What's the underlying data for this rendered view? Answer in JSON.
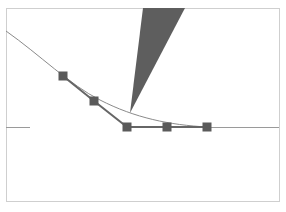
{
  "diagram": {
    "frame": {
      "x": 6,
      "y": 8,
      "width": 273,
      "height": 193,
      "stroke": "#cfcfcf"
    },
    "baseline": {
      "y": 127,
      "left_segment": [
        6,
        30
      ],
      "main_segment": [
        128,
        279
      ],
      "stroke": "#9a9a9a"
    },
    "curve": {
      "path": "M6,31 C40,55 70,85 100,100 C135,118 170,125 207,127",
      "stroke": "#8a8a8a"
    },
    "polyline": {
      "points": "63,76 94,101 127,127 167,127 207,127",
      "stroke": "#666666"
    },
    "markers": [
      {
        "x": 63,
        "y": 76
      },
      {
        "x": 94,
        "y": 101
      },
      {
        "x": 127,
        "y": 127
      },
      {
        "x": 167,
        "y": 127
      },
      {
        "x": 207,
        "y": 127
      }
    ],
    "marker_size": 9,
    "marker_fill": "#5a5a5a",
    "wedge": {
      "points": "143,8 185,8 130,113",
      "fill": "#5e5e5e"
    }
  }
}
